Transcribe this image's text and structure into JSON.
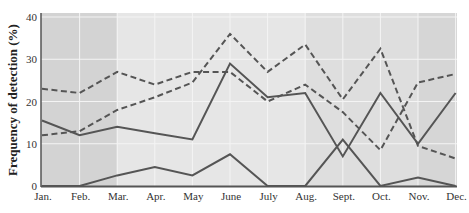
{
  "chart_data": {
    "type": "line",
    "title": "",
    "xlabel": "",
    "ylabel": "Frequency of detection (%)",
    "ylim": [
      0,
      40
    ],
    "yticks": [
      0,
      10,
      20,
      30,
      40
    ],
    "grid": true,
    "legend": null,
    "categories": [
      "Jan.",
      "Feb.",
      "Mar.",
      "Apr.",
      "May",
      "June",
      "July",
      "Aug.",
      "Sept.",
      "Oct.",
      "Nov.",
      "Dec."
    ],
    "series": [
      {
        "name": "Dashed series A",
        "style": "dashed",
        "color": "#555555",
        "values": [
          23,
          22,
          27,
          24,
          27,
          27,
          20,
          24,
          17.5,
          8.5,
          24.5,
          26.5
        ]
      },
      {
        "name": "Dashed series B",
        "style": "dashed",
        "color": "#555555",
        "values": [
          12,
          13,
          18,
          21,
          24.5,
          36,
          27,
          33.5,
          20.5,
          32.5,
          9.5,
          6.5
        ]
      },
      {
        "name": "Solid series A",
        "style": "solid",
        "color": "#555555",
        "values": [
          15.5,
          12,
          14,
          12.5,
          11,
          29,
          21,
          22,
          7,
          22,
          10,
          22
        ]
      },
      {
        "name": "Solid series B",
        "style": "solid",
        "color": "#555555",
        "values": [
          0,
          0,
          2.5,
          4.5,
          2.5,
          7.5,
          0,
          0,
          11,
          0,
          2,
          0
        ]
      }
    ],
    "background_bands": [
      {
        "from": "Jan.",
        "to": "Mar.",
        "color": "#d3d3d3"
      },
      {
        "from": "Mar.",
        "to": "Aug.",
        "color": "#e6e6e6"
      },
      {
        "from": "Aug.",
        "to": "Nov.",
        "color": "#dedede"
      },
      {
        "from": "Nov.",
        "to": "Dec.",
        "color": "#d6d6d6"
      }
    ]
  },
  "colors": {
    "line": "#555555",
    "grid": "#f4f4f4",
    "axis": "#555555"
  }
}
